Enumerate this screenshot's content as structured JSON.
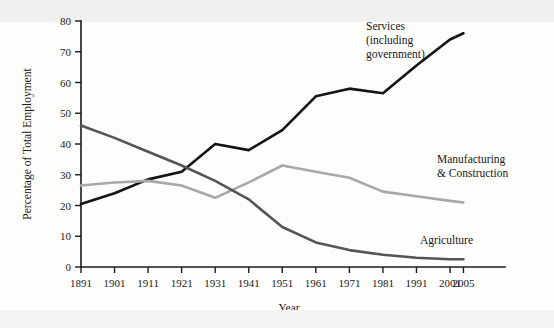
{
  "chart_data": {
    "type": "line",
    "title": "",
    "xlabel": "Year",
    "ylabel": "Percentage of Total Employment",
    "x": [
      1891,
      1901,
      1911,
      1921,
      1931,
      1941,
      1951,
      1961,
      1971,
      1981,
      1991,
      2001,
      2005
    ],
    "xticklabels": [
      "1891",
      "1901",
      "1911",
      "1921",
      "1931",
      "1941",
      "1951",
      "1961",
      "1971",
      "1981",
      "1991",
      "2001",
      "2005"
    ],
    "yticks": [
      0,
      10,
      20,
      30,
      40,
      50,
      60,
      70,
      80
    ],
    "yticklabels": [
      "0",
      "10",
      "20",
      "30",
      "40",
      "50",
      "60",
      "70",
      "80"
    ],
    "ylim": [
      0,
      80
    ],
    "xlim": [
      1891,
      2005
    ],
    "grid": false,
    "legend_position": "inline-annotations",
    "series": [
      {
        "name": "Services (including government)",
        "label_lines": [
          "Services",
          "(including",
          "government)"
        ],
        "color": "#141414",
        "values": [
          20.5,
          24.0,
          28.5,
          31.0,
          40.0,
          38.0,
          44.5,
          55.5,
          58.0,
          56.5,
          65.5,
          74.0,
          76.0
        ]
      },
      {
        "name": "Manufacturing & Construction",
        "label_lines": [
          "Manufacturing",
          "& Construction"
        ],
        "color": "#a8a8a8",
        "values": [
          26.5,
          27.5,
          28.0,
          26.5,
          22.5,
          27.5,
          33.0,
          31.0,
          29.0,
          24.5,
          23.0,
          21.5,
          21.0
        ]
      },
      {
        "name": "Agriculture",
        "label_lines": [
          "Agriculture"
        ],
        "color": "#555555",
        "values": [
          46.0,
          42.0,
          37.5,
          33.0,
          28.0,
          22.0,
          13.0,
          8.0,
          5.5,
          4.0,
          3.0,
          2.5,
          2.5
        ]
      }
    ]
  },
  "annotations": {
    "services": {
      "x": 366,
      "y": 30
    },
    "manufacturing": {
      "x": 437,
      "y": 163
    },
    "agriculture": {
      "x": 420,
      "y": 244
    }
  }
}
